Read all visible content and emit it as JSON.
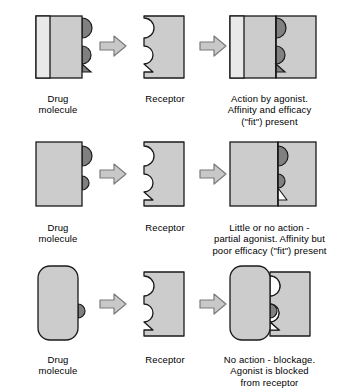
{
  "figure": {
    "type": "diagram",
    "background_color": "#ffffff"
  },
  "palette": {
    "outline": "#1a1a1a",
    "body_fill": "#cccccc",
    "light_strip_fill": "#e9e9e9",
    "bump_fill": "#808080",
    "arrow_fill": "#c8c8c8",
    "arrow_outline": "#7a7a7a",
    "empty_fill": "#ffffff",
    "text_color": "#000000"
  },
  "labels": {
    "drug": "Drug\nmolecule",
    "receptor": "Receptor"
  },
  "rows": [
    {
      "id": "agonist",
      "drug": {
        "shape": "rectangle",
        "rounded": false,
        "has_light_strip": true,
        "bumps": [
          "semicircle",
          "semicircle-with-triangle"
        ]
      },
      "receptor": {
        "notches": [
          "semicircle",
          "semicircle-with-triangle"
        ]
      },
      "complex": {
        "fit": "full",
        "filled_notches": [
          "semicircle",
          "semicircle-with-triangle"
        ],
        "empty_notches": []
      },
      "caption": "Action by agonist.\nAffinity and efficacy\n(\"fit\") present"
    },
    {
      "id": "partial-agonist",
      "drug": {
        "shape": "rectangle",
        "rounded": false,
        "has_light_strip": false,
        "bumps": [
          "semicircle",
          "small-semicircle"
        ]
      },
      "receptor": {
        "notches": [
          "semicircle",
          "semicircle-with-triangle"
        ]
      },
      "complex": {
        "fit": "partial",
        "filled_notches": [
          "semicircle",
          "small-semicircle"
        ],
        "empty_notches": [
          "triangle"
        ]
      },
      "caption": "Little or no action -\npartial agonist. Affinity but\npoor efficacy (\"fit\") present"
    },
    {
      "id": "antagonist",
      "drug": {
        "shape": "rounded-rectangle",
        "rounded": true,
        "has_light_strip": false,
        "bumps": [
          "small-semicircle"
        ]
      },
      "receptor": {
        "notches": [
          "semicircle",
          "semicircle-with-triangle"
        ]
      },
      "complex": {
        "fit": "blocked",
        "filled_notches": [],
        "empty_notches": [
          "semicircle",
          "semicircle-with-triangle"
        ]
      },
      "caption": "No action - blockage.\nAgonist is blocked\nfrom receptor"
    }
  ],
  "arrows": {
    "glyph": "block-arrow-right",
    "count_per_row": 2
  }
}
